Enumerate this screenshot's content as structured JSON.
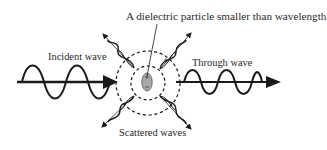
{
  "diagram": {
    "title": "A dielectric particle smaller than wavelength",
    "labels": {
      "incident": "Incident wave",
      "through": "Through wave",
      "scattered": "Scattered waves"
    },
    "elements": {
      "particle": "dielectric-particle",
      "outer_ring": "dashed-outer-circle",
      "inner_ring": "dashed-inner-circle",
      "scattered_directions": [
        "upper-left",
        "upper-right",
        "lower-left",
        "lower-right"
      ]
    },
    "colors": {
      "line": "#1a1a1a",
      "particle_fill": "#a9a9a9",
      "text": "#2a2a2a",
      "background": "#ffffff"
    }
  }
}
